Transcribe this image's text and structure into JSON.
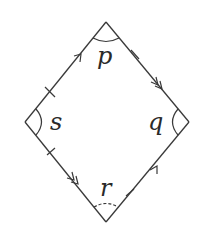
{
  "diagram": {
    "type": "rhombus-angle-diagram",
    "vertices": {
      "top": {
        "label": "p",
        "angle_mark": "solid-arc"
      },
      "right": {
        "label": "q",
        "angle_mark": "solid-arc"
      },
      "bottom": {
        "label": "r",
        "angle_mark": "dashed-arc"
      },
      "left": {
        "label": "s",
        "angle_mark": "solid-arc"
      }
    },
    "edges": [
      {
        "from": "left",
        "to": "top",
        "marks": [
          "tick",
          "single-arrow"
        ]
      },
      {
        "from": "top",
        "to": "right",
        "marks": [
          "tick",
          "double-arrow"
        ]
      },
      {
        "from": "left",
        "to": "bottom",
        "marks": [
          "tick",
          "double-arrow"
        ]
      },
      {
        "from": "bottom",
        "to": "right",
        "marks": [
          "tick",
          "single-arrow"
        ]
      }
    ],
    "colors": {
      "stroke": "#3a3a3a",
      "background": "#ffffff"
    }
  }
}
